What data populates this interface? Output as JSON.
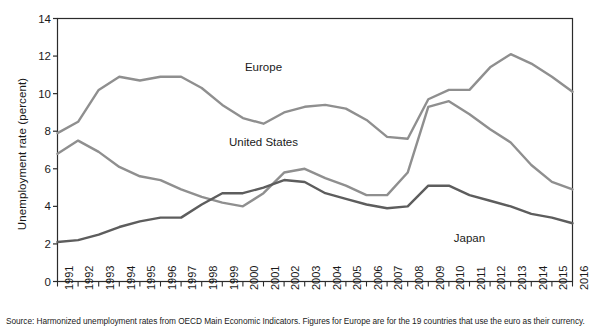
{
  "chart_data": {
    "type": "line",
    "title": "",
    "xlabel": "",
    "ylabel": "Unemployment rate (percent)",
    "ylim": [
      0,
      14
    ],
    "yticks": [
      0,
      2,
      4,
      6,
      8,
      10,
      12,
      14
    ],
    "grid": false,
    "legend_position": "inline-annotations",
    "x": [
      1991,
      1992,
      1993,
      1994,
      1995,
      1996,
      1997,
      1998,
      1999,
      2000,
      2001,
      2002,
      2003,
      2004,
      2005,
      2006,
      2007,
      2008,
      2009,
      2010,
      2011,
      2012,
      2013,
      2014,
      2015,
      2016
    ],
    "categories": [
      "1991",
      "1992",
      "1993",
      "1994",
      "1995",
      "1996",
      "1997",
      "1998",
      "1999",
      "2000",
      "2001",
      "2002",
      "2003",
      "2004",
      "2005",
      "2006",
      "2007",
      "2008",
      "2009",
      "2010",
      "2011",
      "2012",
      "2013",
      "2014",
      "2015",
      "2016"
    ],
    "series": [
      {
        "name": "Europe",
        "color": "#8f8f8f",
        "values": [
          7.9,
          8.5,
          10.2,
          10.9,
          10.7,
          10.9,
          10.9,
          10.3,
          9.4,
          8.7,
          8.4,
          9.0,
          9.3,
          9.4,
          9.2,
          8.6,
          7.7,
          7.6,
          9.7,
          10.2,
          10.2,
          11.4,
          12.1,
          11.6,
          10.9,
          10.1
        ]
      },
      {
        "name": "United States",
        "color": "#8f8f8f",
        "values": [
          6.8,
          7.5,
          6.9,
          6.1,
          5.6,
          5.4,
          4.9,
          4.5,
          4.2,
          4.0,
          4.7,
          5.8,
          6.0,
          5.5,
          5.1,
          4.6,
          4.6,
          5.8,
          9.3,
          9.6,
          8.9,
          8.1,
          7.4,
          6.2,
          5.3,
          4.9
        ]
      },
      {
        "name": "Japan",
        "color": "#5d5d5d",
        "values": [
          2.1,
          2.2,
          2.5,
          2.9,
          3.2,
          3.4,
          3.4,
          4.1,
          4.7,
          4.7,
          5.0,
          5.4,
          5.3,
          4.7,
          4.4,
          4.1,
          3.9,
          4.0,
          5.1,
          5.1,
          4.6,
          4.3,
          4.0,
          3.6,
          3.4,
          3.1
        ]
      }
    ],
    "annotations": [
      {
        "text": "Europe",
        "x": 2001,
        "y": 11.4
      },
      {
        "text": "United States",
        "x": 2001,
        "y": 7.4
      },
      {
        "text": "Japan",
        "x": 2011,
        "y": 2.3
      }
    ],
    "source_note": "Source: Harmonized unemployment rates from OECD Main Economic Indicators.  Figures for Europe are for the 19 countries that use the euro as their currency."
  }
}
